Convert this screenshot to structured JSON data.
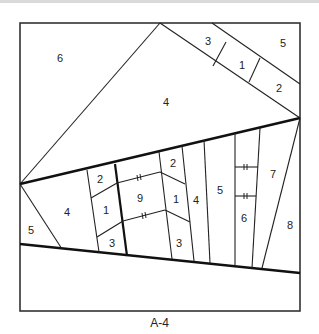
{
  "diagram": {
    "caption": "A-4",
    "sections": {
      "top_left": {
        "pieces": [
          "6"
        ]
      },
      "top_strip": {
        "pieces": [
          "3",
          "1",
          "2",
          "5"
        ]
      },
      "center_triangle": {
        "pieces": [
          "4"
        ]
      },
      "left_unit": {
        "pieces": [
          "5",
          "4",
          "2",
          "1",
          "3"
        ]
      },
      "middle_unit": {
        "pieces": [
          "9",
          "2",
          "1",
          "3",
          "4",
          "5",
          "6",
          "7",
          "8"
        ]
      }
    },
    "labels": {
      "tl6": "6",
      "s3": "3",
      "s1": "1",
      "s2": "2",
      "s5": "5",
      "c4": "4",
      "l5": "5",
      "l4": "4",
      "l2": "2",
      "l1": "1",
      "l3": "3",
      "m9": "9",
      "m2": "2",
      "m1": "1",
      "m3": "3",
      "m4": "4",
      "m5": "5",
      "m6": "6",
      "m7": "7",
      "m8": "8"
    },
    "match_marks": "‖"
  }
}
